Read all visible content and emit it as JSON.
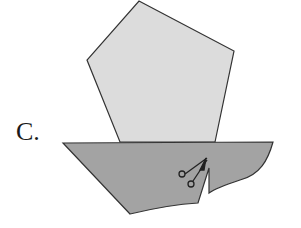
{
  "option_label": "C.",
  "shapes": {
    "pentagon": {
      "fill": "#dcdcdc",
      "stroke": "#333333"
    },
    "base": {
      "fill": "#a3a3a3",
      "stroke": "#333333"
    }
  },
  "icons": {
    "scissors": "scissors-icon"
  }
}
